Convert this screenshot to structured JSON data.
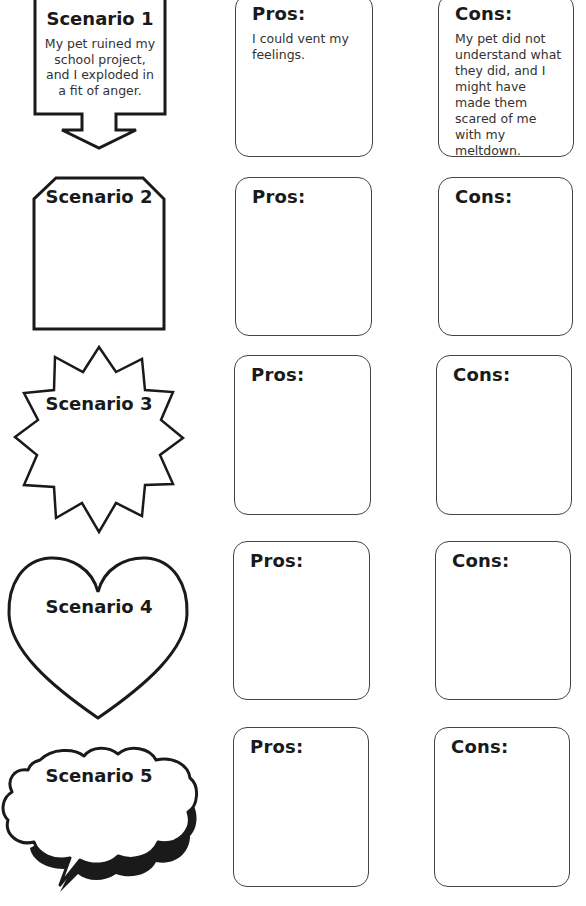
{
  "scenarios": [
    {
      "title": "Scenario 1",
      "shape": "arrow-box",
      "description": "My pet ruined my school project, and I exploded in a fit of anger."
    },
    {
      "title": "Scenario 2",
      "shape": "tag",
      "description": ""
    },
    {
      "title": "Scenario 3",
      "shape": "starburst",
      "description": ""
    },
    {
      "title": "Scenario 4",
      "shape": "heart",
      "description": ""
    },
    {
      "title": "Scenario 5",
      "shape": "cloud-speech-bubble",
      "description": ""
    }
  ],
  "rows": [
    {
      "pros_label": "Pros:",
      "pros_text": "I could vent my feelings.",
      "cons_label": "Cons:",
      "cons_text": "My pet did not understand what they did, and I might have made them scared of me with my meltdown."
    },
    {
      "pros_label": "Pros:",
      "pros_text": "",
      "cons_label": "Cons:",
      "cons_text": ""
    },
    {
      "pros_label": "Pros:",
      "pros_text": "",
      "cons_label": "Cons:",
      "cons_text": ""
    },
    {
      "pros_label": "Pros:",
      "pros_text": "",
      "cons_label": "Cons:",
      "cons_text": ""
    },
    {
      "pros_label": "Pros:",
      "pros_text": "",
      "cons_label": "Cons:",
      "cons_text": ""
    }
  ],
  "colors": {
    "stroke": "#1a1a1a",
    "card_border": "#444444",
    "background": "#ffffff"
  }
}
